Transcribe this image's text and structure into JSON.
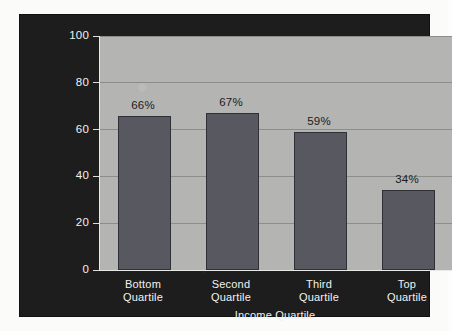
{
  "chart_data": {
    "type": "bar",
    "title": "",
    "categories": [
      "Bottom Quartile",
      "Second Quartile",
      "Third Quartile",
      "Top Quartile"
    ],
    "category_lines": [
      [
        "Bottom",
        "Quartile"
      ],
      [
        "Second",
        "Quartile"
      ],
      [
        "Third",
        "Quartile"
      ],
      [
        "Top",
        "Quartile"
      ]
    ],
    "values": [
      66,
      67,
      59,
      34
    ],
    "value_labels": [
      "66%",
      "67%",
      "59%",
      "34%"
    ],
    "xlabel": "Income Quartile",
    "ylabel": "Percentage with Federal Loans",
    "ylim": [
      0,
      100
    ],
    "yticks": [
      0,
      20,
      40,
      60,
      80,
      100
    ],
    "ytick_labels": [
      "0",
      "20",
      "40",
      "60",
      "80",
      "100"
    ],
    "grid": true,
    "legend": false,
    "colors": {
      "panel_background": "#1d1d1d",
      "plot_background": "#b4b4b2",
      "bar_fill": "#585861",
      "bar_edge": "#2f2f35",
      "gridline": "#8d8d8c",
      "axis_text": "#f2f2f0",
      "value_label_text": "#1b1b1b"
    }
  }
}
